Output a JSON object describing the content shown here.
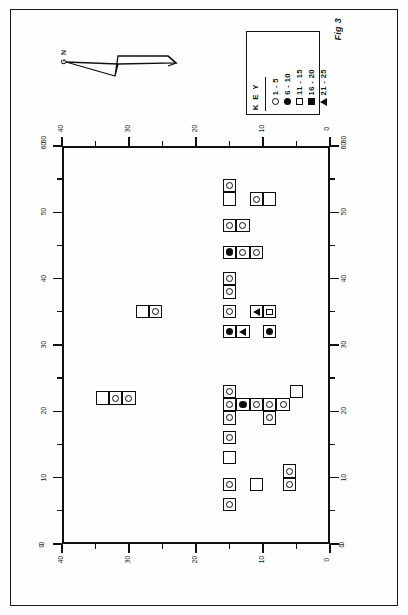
{
  "figure": {
    "caption": "Fig 3",
    "north_label": "G N"
  },
  "key": {
    "title": "K E Y",
    "entries": [
      {
        "symbol": "open-circle",
        "label": "1 - 5"
      },
      {
        "symbol": "filled-circle",
        "label": "6 - 10"
      },
      {
        "symbol": "open-square",
        "label": "11 - 15"
      },
      {
        "symbol": "filled-square",
        "label": "16 - 20"
      },
      {
        "symbol": "triangle",
        "label": "21 - 25"
      }
    ]
  },
  "axes": {
    "top": {
      "labels": [
        "40",
        "30",
        "20",
        "10",
        "0"
      ],
      "left_end": "60",
      "right_end": "60"
    },
    "bottom": {
      "labels": [
        "40",
        "30",
        "20",
        "10",
        "0"
      ],
      "left_end": "0",
      "right_end": "0"
    },
    "left": {
      "labels": [
        "60",
        "50",
        "40",
        "30",
        "20",
        "10",
        "0"
      ]
    },
    "right": {
      "labels": [
        "60",
        "50",
        "40",
        "30",
        "20",
        "10",
        "0"
      ]
    },
    "x_range": [
      0,
      40
    ],
    "y_range": [
      0,
      60
    ],
    "major_step": 10,
    "minor_step": 5,
    "grid": false
  },
  "chart_data": {
    "type": "scatter",
    "title": "Fig 3",
    "xlabel": "",
    "ylabel": "",
    "xlim": [
      0,
      40
    ],
    "ylim": [
      0,
      60
    ],
    "grid": false,
    "legend_position": "top-right",
    "cell_size": 2,
    "symbol_classes": [
      {
        "name": "open-circle",
        "range": "1 - 5"
      },
      {
        "name": "filled-circle",
        "range": "6 - 10"
      },
      {
        "name": "open-square",
        "range": "11 - 15"
      },
      {
        "name": "filled-square",
        "range": "16 - 20"
      },
      {
        "name": "triangle",
        "range": "21 - 25"
      }
    ],
    "cells": [
      {
        "col": 16,
        "row": 53,
        "symbol": "open-circle"
      },
      {
        "col": 16,
        "row": 51,
        "symbol": "none"
      },
      {
        "col": 12,
        "row": 51,
        "symbol": "open-circle"
      },
      {
        "col": 10,
        "row": 51,
        "symbol": "none"
      },
      {
        "col": 16,
        "row": 47,
        "symbol": "open-circle"
      },
      {
        "col": 14,
        "row": 47,
        "symbol": "open-circle"
      },
      {
        "col": 16,
        "row": 43,
        "symbol": "filled-circle"
      },
      {
        "col": 14,
        "row": 43,
        "symbol": "open-circle"
      },
      {
        "col": 12,
        "row": 43,
        "symbol": "open-circle"
      },
      {
        "col": 16,
        "row": 39,
        "symbol": "open-circle"
      },
      {
        "col": 16,
        "row": 37,
        "symbol": "open-circle"
      },
      {
        "col": 16,
        "row": 34,
        "symbol": "open-circle"
      },
      {
        "col": 12,
        "row": 34,
        "symbol": "triangle"
      },
      {
        "col": 10,
        "row": 34,
        "symbol": "open-square"
      },
      {
        "col": 16,
        "row": 31,
        "symbol": "filled-circle"
      },
      {
        "col": 14,
        "row": 31,
        "symbol": "triangle"
      },
      {
        "col": 10,
        "row": 31,
        "symbol": "filled-circle"
      },
      {
        "col": 29,
        "row": 34,
        "symbol": "none"
      },
      {
        "col": 27,
        "row": 34,
        "symbol": "open-circle"
      },
      {
        "col": 35,
        "row": 21,
        "symbol": "none"
      },
      {
        "col": 33,
        "row": 21,
        "symbol": "open-circle"
      },
      {
        "col": 31,
        "row": 21,
        "symbol": "open-circle"
      },
      {
        "col": 16,
        "row": 22,
        "symbol": "open-circle"
      },
      {
        "col": 6,
        "row": 22,
        "symbol": "none"
      },
      {
        "col": 16,
        "row": 20,
        "symbol": "open-circle"
      },
      {
        "col": 14,
        "row": 20,
        "symbol": "filled-circle"
      },
      {
        "col": 12,
        "row": 20,
        "symbol": "open-circle"
      },
      {
        "col": 10,
        "row": 20,
        "symbol": "open-circle"
      },
      {
        "col": 8,
        "row": 20,
        "symbol": "open-circle"
      },
      {
        "col": 16,
        "row": 18,
        "symbol": "open-circle"
      },
      {
        "col": 10,
        "row": 18,
        "symbol": "open-circle"
      },
      {
        "col": 16,
        "row": 15,
        "symbol": "open-circle"
      },
      {
        "col": 16,
        "row": 12,
        "symbol": "none"
      },
      {
        "col": 16,
        "row": 8,
        "symbol": "open-circle"
      },
      {
        "col": 16,
        "row": 5,
        "symbol": "open-circle"
      },
      {
        "col": 12,
        "row": 8,
        "symbol": "none"
      },
      {
        "col": 7,
        "row": 10,
        "symbol": "open-circle"
      },
      {
        "col": 7,
        "row": 8,
        "symbol": "open-circle"
      }
    ]
  }
}
